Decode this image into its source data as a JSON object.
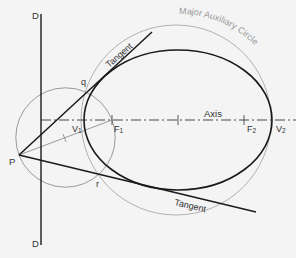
{
  "diagram": {
    "labels": {
      "directrix_top": "D",
      "directrix_bottom": "D",
      "point_p": "P",
      "point_q": "q",
      "point_r": "r",
      "vertex_1": "V",
      "vertex_1_sub": "1",
      "focus_1": "F",
      "focus_1_sub": "1",
      "focus_2": "F",
      "focus_2_sub": "2",
      "vertex_2": "V",
      "vertex_2_sub": "2",
      "axis": "Axis",
      "tangent_upper": "Tangent",
      "tangent_lower": "Tangent",
      "major_auxiliary_circle": "Major Auxiliary Circle"
    },
    "colors": {
      "background": "#f4f4f4",
      "main_stroke": "#1a1a1a",
      "construction_stroke": "#9a9a9a",
      "label_text": "#333333",
      "label_gray": "#999999"
    }
  }
}
